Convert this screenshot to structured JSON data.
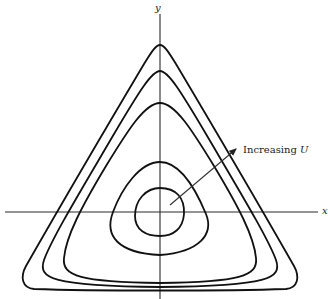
{
  "diagram": {
    "axes": {
      "x_label": "x",
      "y_label": "y"
    },
    "contours": {
      "count": 5,
      "shape": "rounded-triangle",
      "description": "Nested closed level curves, roughly circular at center becoming triangular outward"
    },
    "annotation": {
      "text": "Increasing ",
      "variable": "U"
    },
    "colors": {
      "line": "#111111",
      "background": "#ffffff"
    }
  }
}
